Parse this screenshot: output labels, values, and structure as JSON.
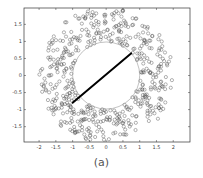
{
  "caption": "(a)",
  "chart_data": {
    "type": "scatter",
    "title": "",
    "xlabel": "",
    "ylabel": "",
    "xlim": [
      -2.45,
      2.5
    ],
    "ylim": [
      -1.95,
      1.98
    ],
    "grid": false,
    "legend": null,
    "x_ticks": [
      -2,
      -1.5,
      -1,
      -0.5,
      0,
      0.5,
      1,
      1.5,
      2
    ],
    "x_tick_labels": [
      "-2",
      "-1.5",
      "-1",
      "-0.5",
      "0",
      "0.5",
      "1",
      "1.5",
      "2"
    ],
    "y_ticks": [
      1.5,
      1,
      0.5,
      0,
      -0.5,
      -1,
      -1.5
    ],
    "y_tick_labels": [
      "1.5",
      "1",
      "0.5",
      "0",
      "-0.5",
      "-1",
      "-1.5"
    ],
    "marker": "open-circle",
    "marker_color": "#555555",
    "ring": {
      "inner_radius": 1.0,
      "outer_radius": 2.0,
      "point_count": 520
    },
    "reference_circle": {
      "cx": 0,
      "cy": 0,
      "r": 1.0,
      "color": "#999999"
    },
    "line_segment": {
      "x1": -1.0,
      "y1": -0.8,
      "x2": 0.75,
      "y2": 0.65,
      "color": "#000000",
      "width": 2
    }
  },
  "colors": {
    "axis": "#333333",
    "marker": "#555555",
    "circle": "#9a9a9a",
    "line": "#000000"
  }
}
